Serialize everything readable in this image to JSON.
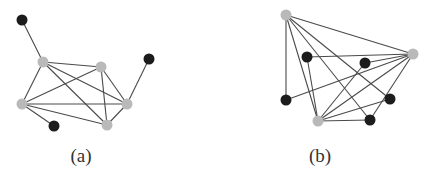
{
  "colors": {
    "background": "#ffffff",
    "edge": "#4a4a4a",
    "gray_node": "#b9b9b9",
    "black_node": "#1c1c1c",
    "caption": "#333333"
  },
  "node_radius": 5.5,
  "subfigures": [
    {
      "id": "a",
      "caption": "(a)",
      "caption_pos": [
        81,
        162
      ],
      "nodes": [
        {
          "id": "a-g1",
          "type": "gray",
          "x": 43,
          "y": 62
        },
        {
          "id": "a-g2",
          "type": "gray",
          "x": 101,
          "y": 67
        },
        {
          "id": "a-g3",
          "type": "gray",
          "x": 127,
          "y": 104
        },
        {
          "id": "a-g4",
          "type": "gray",
          "x": 107,
          "y": 125
        },
        {
          "id": "a-g5",
          "type": "gray",
          "x": 22,
          "y": 104
        },
        {
          "id": "a-b1",
          "type": "black",
          "x": 22,
          "y": 20
        },
        {
          "id": "a-b2",
          "type": "black",
          "x": 149,
          "y": 59
        },
        {
          "id": "a-b3",
          "type": "black",
          "x": 54,
          "y": 126
        }
      ],
      "edges": [
        [
          "a-g1",
          "a-g2"
        ],
        [
          "a-g1",
          "a-g3"
        ],
        [
          "a-g1",
          "a-g4"
        ],
        [
          "a-g1",
          "a-g5"
        ],
        [
          "a-g2",
          "a-g5"
        ],
        [
          "a-g2",
          "a-g3"
        ],
        [
          "a-g2",
          "a-g4"
        ],
        [
          "a-g5",
          "a-g3"
        ],
        [
          "a-g5",
          "a-g4"
        ],
        [
          "a-g4",
          "a-g3"
        ],
        [
          "a-b1",
          "a-g1"
        ],
        [
          "a-b2",
          "a-g3"
        ],
        [
          "a-b3",
          "a-g5"
        ]
      ]
    },
    {
      "id": "b",
      "caption": "(b)",
      "caption_pos": [
        320,
        162
      ],
      "nodes": [
        {
          "id": "b-gt",
          "type": "gray",
          "x": 286,
          "y": 15
        },
        {
          "id": "b-gr",
          "type": "gray",
          "x": 413,
          "y": 54
        },
        {
          "id": "b-gb",
          "type": "gray",
          "x": 318,
          "y": 121
        },
        {
          "id": "b-ba",
          "type": "black",
          "x": 307,
          "y": 57
        },
        {
          "id": "b-bb",
          "type": "black",
          "x": 365,
          "y": 63
        },
        {
          "id": "b-bc",
          "type": "black",
          "x": 286,
          "y": 100
        },
        {
          "id": "b-bd",
          "type": "black",
          "x": 390,
          "y": 99
        },
        {
          "id": "b-be",
          "type": "black",
          "x": 370,
          "y": 120
        }
      ],
      "edges": [
        [
          "b-gt",
          "b-gr"
        ],
        [
          "b-gt",
          "b-gb"
        ],
        [
          "b-gt",
          "b-bc"
        ],
        [
          "b-gt",
          "b-bd"
        ],
        [
          "b-gt",
          "b-be"
        ],
        [
          "b-gr",
          "b-ba"
        ],
        [
          "b-gr",
          "b-bb"
        ],
        [
          "b-gr",
          "b-bc"
        ],
        [
          "b-gr",
          "b-gb"
        ],
        [
          "b-gr",
          "b-be"
        ],
        [
          "b-gb",
          "b-ba"
        ],
        [
          "b-gb",
          "b-bb"
        ],
        [
          "b-gb",
          "b-bd"
        ],
        [
          "b-gb",
          "b-be"
        ]
      ]
    }
  ]
}
